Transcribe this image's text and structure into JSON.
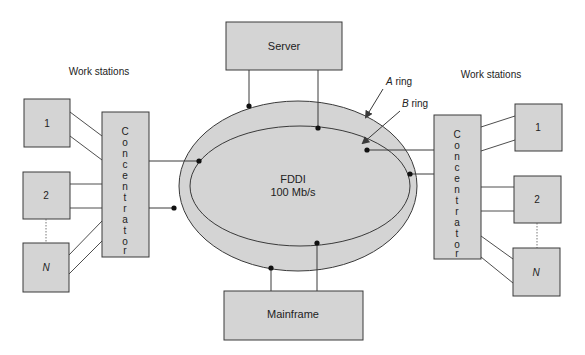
{
  "colors": {
    "fill": "#d4d4d4",
    "stroke": "#3a3a3a",
    "node_dot": "#111111",
    "text": "#222222"
  },
  "ring": {
    "label_line1": "FDDI",
    "label_line2": "100 Mb/s",
    "a_ring_letter": "A",
    "a_ring_suffix": " ring",
    "b_ring_letter": "B",
    "b_ring_suffix": " ring"
  },
  "server": {
    "label": "Server"
  },
  "mainframe": {
    "label": "Mainframe"
  },
  "left_group": {
    "heading": "Work stations",
    "concentrator_letters": [
      "C",
      "o",
      "n",
      "c",
      "e",
      "n",
      "t",
      "r",
      "a",
      "t",
      "o",
      "r"
    ],
    "stations": [
      {
        "label": "1",
        "italic": false
      },
      {
        "label": "2",
        "italic": false
      },
      {
        "label": "N",
        "italic": true
      }
    ]
  },
  "right_group": {
    "heading": "Work stations",
    "concentrator_letters": [
      "C",
      "o",
      "n",
      "c",
      "e",
      "n",
      "t",
      "r",
      "a",
      "t",
      "o",
      "r"
    ],
    "stations": [
      {
        "label": "1",
        "italic": false
      },
      {
        "label": "2",
        "italic": false
      },
      {
        "label": "N",
        "italic": true
      }
    ]
  }
}
